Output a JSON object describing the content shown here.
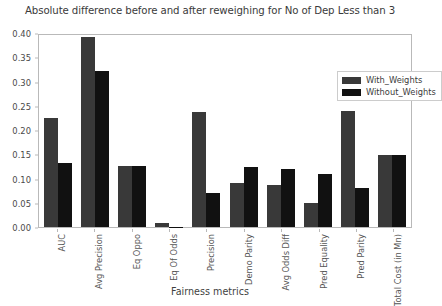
{
  "chart_data": {
    "type": "bar",
    "title": "Absolute difference before and after reweighing for No of Dep Less than 3",
    "xlabel": "Fairness metrics",
    "ylabel": "",
    "ylim": [
      0.0,
      0.4
    ],
    "yticks": [
      "0.00",
      "0.05",
      "0.10",
      "0.15",
      "0.20",
      "0.25",
      "0.30",
      "0.35",
      "0.40"
    ],
    "ytick_values": [
      0.0,
      0.05,
      0.1,
      0.15,
      0.2,
      0.25,
      0.3,
      0.35,
      0.4
    ],
    "grid": false,
    "legend_position": "upper right",
    "categories": [
      "AUC",
      "Avg Precision",
      "Eq Oppo",
      "Eq Of Odds",
      "Precision",
      "Demo Parity",
      "Avg Odds Diff",
      "Pred Equality",
      "Pred Parity",
      "Total Cost (in Mn)"
    ],
    "series": [
      {
        "name": "With_Weights",
        "color": "#393939",
        "values": [
          0.225,
          0.391,
          0.125,
          0.008,
          0.238,
          0.09,
          0.086,
          0.049,
          0.239,
          0.148
        ]
      },
      {
        "name": "Without_Weights",
        "color": "#111111",
        "values": [
          0.133,
          0.322,
          0.125,
          0.001,
          0.07,
          0.124,
          0.119,
          0.11,
          0.081,
          0.148
        ]
      }
    ]
  }
}
